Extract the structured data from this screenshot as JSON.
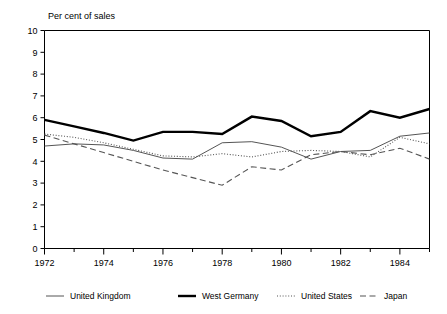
{
  "chart_data": {
    "type": "line",
    "title": "Per cent of sales",
    "xlabel": "",
    "ylabel": "",
    "ylim": [
      0,
      10
    ],
    "xlim": [
      1972,
      1985
    ],
    "ytick_step": 1,
    "yticks": [
      0,
      1,
      2,
      3,
      4,
      5,
      6,
      7,
      8,
      9,
      10
    ],
    "xticks": [
      1972,
      1973,
      1974,
      1975,
      1976,
      1977,
      1978,
      1979,
      1980,
      1981,
      1982,
      1983,
      1984,
      1985
    ],
    "xtick_labels": [
      "1972",
      "",
      "1974",
      "",
      "1976",
      "",
      "1978",
      "",
      "1980",
      "",
      "1982",
      "",
      "1984",
      ""
    ],
    "x": [
      1972,
      1973,
      1974,
      1975,
      1976,
      1977,
      1978,
      1979,
      1980,
      1981,
      1982,
      1983,
      1984,
      1985
    ],
    "grid": false,
    "legend_position": "bottom",
    "series": [
      {
        "name": "United Kingdom",
        "style": "solid-thin",
        "color": "#555555",
        "values": [
          4.7,
          4.8,
          4.75,
          4.5,
          4.15,
          4.1,
          4.85,
          4.9,
          4.65,
          4.1,
          4.45,
          4.5,
          5.15,
          5.3
        ]
      },
      {
        "name": "West Germany",
        "style": "solid-thick",
        "color": "#000000",
        "values": [
          5.9,
          5.6,
          5.3,
          4.95,
          5.35,
          5.35,
          5.25,
          6.05,
          5.85,
          5.15,
          5.35,
          6.3,
          6.0,
          6.4
        ]
      },
      {
        "name": "United States",
        "style": "dotted",
        "color": "#555555",
        "values": [
          5.25,
          5.1,
          4.85,
          4.55,
          4.25,
          4.2,
          4.35,
          4.2,
          4.45,
          4.5,
          4.45,
          4.2,
          5.1,
          4.8
        ]
      },
      {
        "name": "Japan",
        "style": "dashed",
        "color": "#555555",
        "values": [
          5.2,
          4.8,
          4.4,
          4.0,
          3.6,
          3.25,
          2.9,
          3.75,
          3.6,
          4.3,
          4.45,
          4.3,
          4.6,
          4.1
        ]
      }
    ]
  },
  "legend": {
    "items": [
      {
        "label": "United Kingdom"
      },
      {
        "label": "West Germany"
      },
      {
        "label": "United States"
      },
      {
        "label": "Japan"
      }
    ]
  }
}
